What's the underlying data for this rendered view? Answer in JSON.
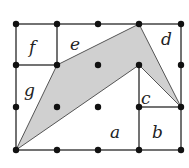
{
  "diagram": {
    "grid": {
      "columns": 5,
      "rows": 4,
      "x": [
        16,
        57,
        98,
        139,
        181
      ],
      "y": [
        24,
        65,
        107,
        150
      ]
    },
    "shaded_polygon": {
      "fill": "#d0d0d0",
      "vertices": [
        [
          16,
          150
        ],
        [
          57,
          65
        ],
        [
          139,
          24
        ],
        [
          181,
          107
        ],
        [
          139,
          65
        ]
      ]
    },
    "regions": [
      {
        "id": "a",
        "label": "a",
        "x": 116,
        "y": 136
      },
      {
        "id": "b",
        "label": "b",
        "x": 157,
        "y": 136
      },
      {
        "id": "c",
        "label": "c",
        "x": 145,
        "y": 104
      },
      {
        "id": "d",
        "label": "d",
        "x": 166,
        "y": 44
      },
      {
        "id": "e",
        "label": "e",
        "x": 76,
        "y": 48
      },
      {
        "id": "f",
        "label": "f",
        "x": 33,
        "y": 52
      },
      {
        "id": "g",
        "label": "g",
        "x": 29,
        "y": 95
      }
    ]
  }
}
